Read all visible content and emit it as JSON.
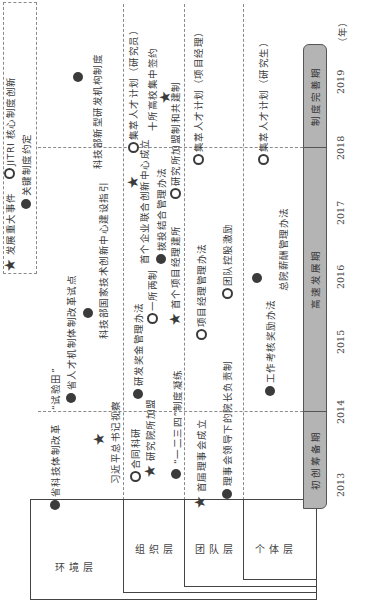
{
  "legend": {
    "items": [
      {
        "icon": "star",
        "label": "发展重大事件"
      },
      {
        "icon": "ring",
        "label": "JITRI 核心制度创新"
      },
      {
        "icon": "dot",
        "label": "关键制度约定"
      }
    ]
  },
  "layers": [
    {
      "label": "环境层"
    },
    {
      "label": "组织层"
    },
    {
      "label": "团队层"
    },
    {
      "label": "个体层"
    }
  ],
  "phases": [
    {
      "label": "初创筹备期"
    },
    {
      "label": "高速发展期"
    },
    {
      "label": "制度完善期"
    }
  ],
  "years": [
    "2013",
    "2014",
    "2015",
    "2016",
    "2017",
    "2018",
    "2019",
    "（年）"
  ],
  "events": {
    "environment": [
      {
        "icon": "dot",
        "label": "省科技体制改革"
      },
      {
        "icon": "none",
        "label": "“试验田”"
      },
      {
        "icon": "star",
        "label": "习近平总书记视察"
      },
      {
        "icon": "dot",
        "label": "省人才机制体制改革试点"
      },
      {
        "icon": "dot",
        "label": "科技部国家技术创新中心建设指引"
      },
      {
        "icon": "dot",
        "label": "科技部新型研发机构制度"
      }
    ],
    "organization": [
      {
        "icon": "ring",
        "label": "合同科研"
      },
      {
        "icon": "star",
        "label": "研究院所加盟"
      },
      {
        "icon": "dot",
        "label": "“一二三四”制度凝练"
      },
      {
        "icon": "dot",
        "label": "研发奖金管理办法"
      },
      {
        "icon": "ring",
        "label": "一所两制"
      },
      {
        "icon": "star",
        "label": "首个项目经理建所"
      },
      {
        "icon": "dot",
        "label": "拨投结合管理办法"
      },
      {
        "icon": "star",
        "label": "首个企业联合创新中心成立"
      },
      {
        "icon": "ring",
        "label": "研究所加盟制和共建制"
      },
      {
        "icon": "ring",
        "label": "集萃人才计划（研究员）"
      },
      {
        "icon": "star",
        "label": "十所高校集中签约"
      }
    ],
    "team": [
      {
        "icon": "star",
        "label": "首届理事会成立"
      },
      {
        "icon": "dot",
        "label": "理事会领导下的院长负责制"
      },
      {
        "icon": "ring",
        "label": "项目经理管理办法"
      },
      {
        "icon": "ring",
        "label": "团队控股激励"
      },
      {
        "icon": "ring",
        "label": "集萃人才计划（项目经理）"
      }
    ],
    "individual": [
      {
        "icon": "dot",
        "label": "工作考核奖励办法"
      },
      {
        "icon": "dot",
        "label": "总院薪酬管理办法"
      },
      {
        "icon": "ring",
        "label": "集萃人才计划（研究生）"
      }
    ]
  },
  "colors": {
    "phase_fill": "#b4b4b4",
    "marker": "#3b3b3b",
    "dash": "#8a8a8a"
  }
}
